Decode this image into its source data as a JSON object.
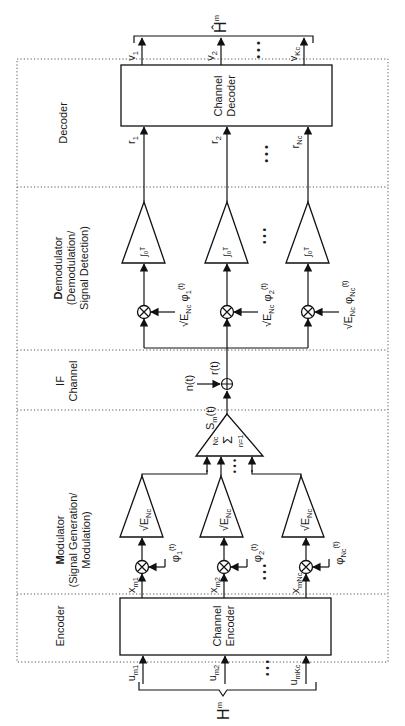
{
  "orientation": "rotated 90deg counter-clockwise",
  "sections": {
    "decoder": "Decoder",
    "demodulator_title_bold": "D",
    "demodulator_title_rest": "emodulator",
    "demodulator_line2": "(Demodulation/",
    "demodulator_line3": "Signal Detection)",
    "if_line1": "IF",
    "if_line2": "Channel",
    "modulator_title_bold": "M",
    "modulator_title_rest": "odulator",
    "modulator_line2": "(Signal Generation/",
    "modulator_line3": "Modulation)",
    "encoder": "Encoder"
  },
  "blocks": {
    "channel_decoder_line1": "Channel",
    "channel_decoder_line2": "Decoder",
    "channel_encoder_line1": "Channel",
    "channel_encoder_line2": "Encoder"
  },
  "signals": {
    "output_message": "Ĥ",
    "output_message_sub": "m",
    "decoder_outputs": [
      {
        "base": "v",
        "sub": "1"
      },
      {
        "base": "v",
        "sub": "2"
      },
      {
        "base": "v",
        "sub": "Kc"
      }
    ],
    "decoder_inputs": [
      {
        "base": "r",
        "sub": "1"
      },
      {
        "base": "r",
        "sub": "2"
      },
      {
        "base": "r",
        "sub": "Nc"
      }
    ],
    "integrator_label": "∫₀ᵀ",
    "demod_refs": [
      {
        "text": "√E",
        "sub": "Nc",
        "phi": "φ",
        "phi_sub": "1",
        "arg": "(t)"
      },
      {
        "text": "√E",
        "sub": "Nc",
        "phi": "φ",
        "phi_sub": "2",
        "arg": "(t)"
      },
      {
        "text": "√E",
        "sub": "Nc",
        "phi": "φ",
        "phi_sub": "Nc",
        "arg": "(t)"
      }
    ],
    "noise": "n(t)",
    "received": "r(t)",
    "transmitted": "S",
    "transmitted_sub": "m",
    "transmitted_arg": "(t)",
    "summer_label": "Σ",
    "summer_top": "Nc",
    "summer_bottom": "n=1",
    "mod_gain": "√E",
    "mod_gain_sub": "Nc",
    "mod_basis": [
      {
        "phi": "φ",
        "sub": "1",
        "arg": "(t)"
      },
      {
        "phi": "φ",
        "sub": "2",
        "arg": "(t)"
      },
      {
        "phi": "φ",
        "sub": "Nc",
        "arg": "(t)"
      }
    ],
    "encoder_outputs": [
      {
        "base": "x",
        "sub": "m1"
      },
      {
        "base": "x",
        "sub": "m2"
      },
      {
        "base": "x",
        "sub": "mNc"
      }
    ],
    "encoder_inputs": [
      {
        "base": "u",
        "sub": "m1"
      },
      {
        "base": "u",
        "sub": "m2"
      },
      {
        "base": "u",
        "sub": "mKc"
      }
    ],
    "input_message": "H",
    "input_message_sub": "m",
    "ellipsis": "• • •"
  }
}
